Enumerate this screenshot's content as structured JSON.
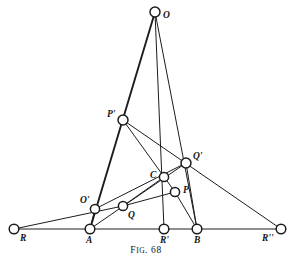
{
  "figure": {
    "caption_prefix": "F",
    "caption_small": "IG",
    "caption_suffix": ". 68",
    "caption_full": "FIG. 68",
    "width": 292,
    "height": 264,
    "background_color": "#ffffff",
    "ink_color": "#1c1c1c",
    "vertex_fill": "#ffffff"
  },
  "points": [
    {
      "id": "O",
      "label": "O",
      "x": 155,
      "y": 12,
      "r": 5.0,
      "label_x": 163,
      "label_y": 11
    },
    {
      "id": "Pp",
      "label": "P'",
      "x": 123,
      "y": 120,
      "r": 5.0,
      "label_x": 107,
      "label_y": 110
    },
    {
      "id": "Qp",
      "label": "Q'",
      "x": 186,
      "y": 163,
      "r": 5.0,
      "label_x": 193,
      "label_y": 152
    },
    {
      "id": "C",
      "label": "C",
      "x": 164,
      "y": 177,
      "r": 4.6,
      "label_x": 150,
      "label_y": 171
    },
    {
      "id": "P",
      "label": "P",
      "x": 175,
      "y": 192,
      "r": 4.6,
      "label_x": 183,
      "label_y": 186
    },
    {
      "id": "Op",
      "label": "O'",
      "x": 95,
      "y": 209,
      "r": 4.6,
      "label_x": 80,
      "label_y": 196
    },
    {
      "id": "Q",
      "label": "Q",
      "x": 123,
      "y": 206,
      "r": 4.6,
      "label_x": 128,
      "label_y": 211
    },
    {
      "id": "R",
      "label": "R",
      "x": 14,
      "y": 229,
      "r": 4.8,
      "label_x": 20,
      "label_y": 234
    },
    {
      "id": "A",
      "label": "A",
      "x": 90,
      "y": 229,
      "r": 4.8,
      "label_x": 86,
      "label_y": 236
    },
    {
      "id": "Rp",
      "label": "R'",
      "x": 164,
      "y": 229,
      "r": 4.8,
      "label_x": 160,
      "label_y": 236
    },
    {
      "id": "B",
      "label": "B",
      "x": 197,
      "y": 229,
      "r": 4.8,
      "label_x": 194,
      "label_y": 236
    },
    {
      "id": "Rpp",
      "label": "R''",
      "x": 281,
      "y": 229,
      "r": 4.8,
      "label_x": 262,
      "label_y": 234
    }
  ],
  "segments": [
    {
      "name": "baseline-R-to-Rpp",
      "from": "R",
      "to": "Rpp",
      "weight": "thin"
    },
    {
      "name": "O-to-A-through-Pp",
      "from": "O",
      "to": "A",
      "weight": "thick"
    },
    {
      "name": "O-to-Rp-through-C",
      "from": "O",
      "to": "Rp",
      "weight": "thin"
    },
    {
      "name": "O-to-B-through-Qp",
      "from": "O",
      "to": "B",
      "weight": "thin"
    },
    {
      "name": "Pp-to-Rpp-through-Qp",
      "from": "Pp",
      "to": "Rpp",
      "weight": "thin"
    },
    {
      "name": "Pp-to-P-through-C",
      "from": "Pp",
      "to": "P",
      "weight": "thin"
    },
    {
      "name": "R-to-Q-through-Op",
      "from": "R",
      "to": "Q",
      "weight": "thin"
    },
    {
      "name": "Op-to-Qp-through-Q",
      "from": "Op",
      "to": "Qp",
      "weight": "thin"
    },
    {
      "name": "Op-to-A",
      "from": "Op",
      "to": "A",
      "weight": "thin"
    },
    {
      "name": "A-to-Qp-through-Q",
      "from": "A",
      "to": "Qp",
      "weight": "thin"
    },
    {
      "name": "Q-to-P",
      "from": "Q",
      "to": "P",
      "weight": "thin"
    },
    {
      "name": "C-to-Q",
      "from": "C",
      "to": "Q",
      "weight": "thin"
    },
    {
      "name": "P-to-B",
      "from": "P",
      "to": "B",
      "weight": "thin"
    },
    {
      "name": "Qp-to-B",
      "from": "Qp",
      "to": "B",
      "weight": "thin"
    }
  ]
}
